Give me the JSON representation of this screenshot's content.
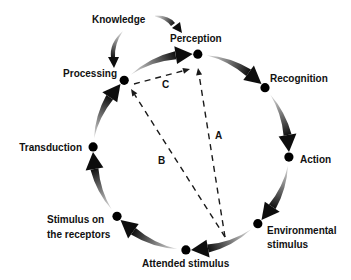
{
  "knowledge": {
    "label": "Knowledge",
    "influences": [
      "processing",
      "perception"
    ]
  },
  "cycle": {
    "direction": "clockwise",
    "nodes": [
      {
        "id": "perception",
        "label": "Perception"
      },
      {
        "id": "recognition",
        "label": "Recognition"
      },
      {
        "id": "action",
        "label": "Action"
      },
      {
        "id": "environmental-stimulus",
        "label_lines": [
          "Environmental",
          "stimulus"
        ]
      },
      {
        "id": "attended-stimulus",
        "label": "Attended stimulus"
      },
      {
        "id": "stimulus-on-receptors",
        "label_lines": [
          "Stimulus on",
          "the receptors"
        ]
      },
      {
        "id": "transduction",
        "label": "Transduction"
      },
      {
        "id": "processing",
        "label": "Processing"
      }
    ],
    "edges": [
      {
        "from": "processing",
        "to": "perception"
      },
      {
        "from": "perception",
        "to": "recognition"
      },
      {
        "from": "recognition",
        "to": "action"
      },
      {
        "from": "action",
        "to": "environmental-stimulus"
      },
      {
        "from": "environmental-stimulus",
        "to": "attended-stimulus"
      },
      {
        "from": "attended-stimulus",
        "to": "stimulus-on-receptors"
      },
      {
        "from": "stimulus-on-receptors",
        "to": "transduction"
      },
      {
        "from": "transduction",
        "to": "processing"
      }
    ]
  },
  "dashed_paths": [
    {
      "label": "A",
      "from": "environmental-stimulus/attended-stimulus",
      "to": "perception"
    },
    {
      "label": "B",
      "from": "environmental-stimulus/attended-stimulus",
      "to": "processing"
    },
    {
      "label": "C",
      "from": "processing",
      "to": "perception"
    }
  ],
  "colors": {
    "arrow_start": "#e2e2e2",
    "arrow_end": "#111111",
    "text": "#111111",
    "background": "#ffffff"
  }
}
